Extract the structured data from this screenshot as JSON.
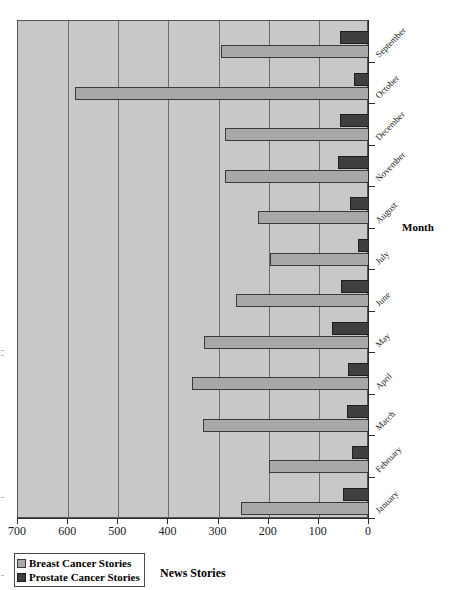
{
  "chart_data": {
    "type": "bar",
    "orientation": "horizontal",
    "title": "",
    "xlabel": "News Stories",
    "ylabel": "Month",
    "xlim": [
      700,
      0
    ],
    "x_reversed": true,
    "xticks": [
      700,
      600,
      500,
      400,
      300,
      200,
      100,
      0
    ],
    "xtick_labels": [
      "700",
      "600",
      "500",
      "400",
      "300",
      "200",
      "100",
      "0"
    ],
    "grid": true,
    "grid_axis": "x",
    "legend_position": "bottom-left",
    "categories": [
      "September",
      "October",
      "December",
      "November",
      "August",
      "July",
      "June",
      "May",
      "April",
      "March",
      "February",
      "January"
    ],
    "series": [
      {
        "name": "Breast Cancer Stories",
        "color": "#a8a8a8",
        "values": [
          296,
          586,
          288,
          288,
          222,
          198,
          266,
          330,
          352,
          332,
          200,
          256
        ]
      },
      {
        "name": "Prostate Cancer Stories",
        "color": "#3f3f3f",
        "values": [
          58,
          30,
          58,
          62,
          38,
          22,
          56,
          74,
          42,
          44,
          34,
          52
        ]
      }
    ]
  },
  "legend": {
    "items": [
      {
        "label": "Breast Cancer Stories",
        "swatch": "breast"
      },
      {
        "label": "Prostate Cancer Stories",
        "swatch": "prostate"
      }
    ]
  },
  "axes": {
    "x_title": "News Stories",
    "y_title": "Month"
  }
}
